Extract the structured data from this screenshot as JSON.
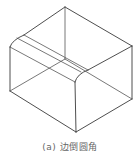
{
  "figure": {
    "type": "isometric wireframe of box with one edge filleted",
    "caption": "(a) 边倒圆角",
    "colors": {
      "line": "#3a3a3a",
      "caption": "#666666",
      "background": "#ffffff"
    }
  }
}
